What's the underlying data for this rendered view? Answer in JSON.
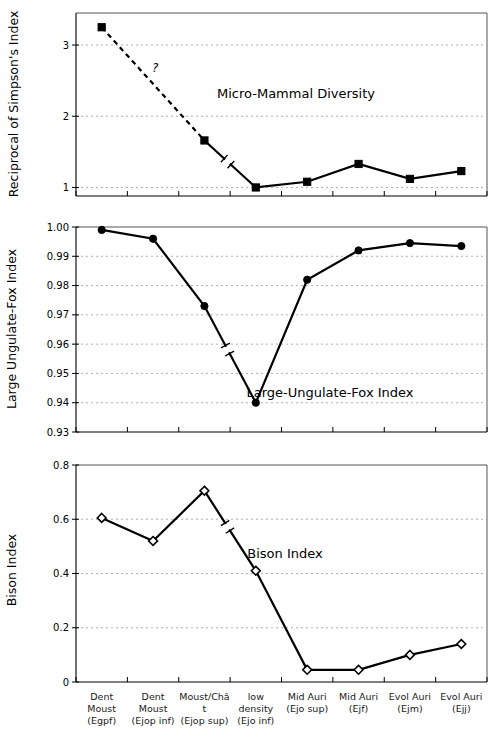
{
  "figure": {
    "width": 503,
    "height": 737,
    "background": "#ffffff",
    "ink_color": "#000000",
    "grid_color": "#9a9a9a"
  },
  "x_categories": [
    {
      "top": "Dent Moust",
      "bottom": "(Egpf)"
    },
    {
      "top": "Dent Moust",
      "bottom": "(Ejop inf)"
    },
    {
      "top": "Moust/Châ t",
      "bottom": "(Ejop sup)"
    },
    {
      "top": "low density",
      "bottom": "(Ejo inf)"
    },
    {
      "top": "Mid Auri",
      "bottom": "(Ejo sup)"
    },
    {
      "top": "Mid Auri",
      "bottom": "(Ejf)"
    },
    {
      "top": "Evol Auri",
      "bottom": "(Ejm)"
    },
    {
      "top": "Evol Auri",
      "bottom": "(Ejj)"
    }
  ],
  "chart_data": [
    {
      "type": "line",
      "id": "micro-mammal-diversity",
      "title": "Micro-Mammal Diversity",
      "ylabel": "Reciprocal of Simpson's Index",
      "xlabel": "",
      "categories": [
        "Dent Moust (Egpf)",
        "Dent Moust (Ejop inf)",
        "Moust/Châ t (Ejop sup)",
        "low density (Ejo inf)",
        "Mid Auri (Ejo sup)",
        "Mid Auri (Ejf)",
        "Evol Auri (Ejm)",
        "Evol Auri (Ejj)"
      ],
      "values": [
        3.25,
        null,
        1.66,
        1.0,
        1.08,
        1.33,
        1.12,
        1.23
      ],
      "ylim": [
        0.88,
        3.45
      ],
      "yticks": [
        1,
        2,
        3
      ],
      "ytick_labels": [
        "1",
        "2",
        "3"
      ],
      "grid": true,
      "marker": "filled-square",
      "dashed_segment": {
        "from_index": 0,
        "to_index": 2,
        "label": "?"
      },
      "break_marker_between": [
        2,
        3
      ],
      "legend": "none",
      "note": "Value for category 2 (Dent Moust Ejop inf) not measured; dashed interpolation with question mark"
    },
    {
      "type": "line",
      "id": "large-ungulate-fox-index",
      "title": "Large-Ungulate-Fox Index",
      "ylabel": "Large Ungulate-Fox Index",
      "xlabel": "",
      "categories": [
        "Dent Moust (Egpf)",
        "Dent Moust (Ejop inf)",
        "Moust/Châ t (Ejop sup)",
        "low density (Ejo inf)",
        "Mid Auri (Ejo sup)",
        "Mid Auri (Ejf)",
        "Evol Auri (Ejm)",
        "Evol Auri (Ejj)"
      ],
      "values": [
        0.999,
        0.996,
        0.973,
        0.94,
        0.982,
        0.992,
        0.9945,
        0.9935
      ],
      "ylim": [
        0.93,
        1.0
      ],
      "yticks": [
        0.93,
        0.94,
        0.95,
        0.96,
        0.97,
        0.98,
        0.99,
        1.0
      ],
      "ytick_labels": [
        "0.93",
        "0.94",
        "0.95",
        "0.96",
        "0.97",
        "0.98",
        "0.99",
        "1.00"
      ],
      "grid": true,
      "marker": "filled-circle",
      "break_marker_between": [
        2,
        3
      ],
      "legend": "none"
    },
    {
      "type": "line",
      "id": "bison-index",
      "title": "Bison Index",
      "ylabel": "Bison Index",
      "xlabel": "",
      "categories": [
        "Dent Moust (Egpf)",
        "Dent Moust (Ejop inf)",
        "Moust/Châ t (Ejop sup)",
        "low density (Ejo inf)",
        "Mid Auri (Ejo sup)",
        "Mid Auri (Ejf)",
        "Evol Auri (Ejm)",
        "Evol Auri (Ejj)"
      ],
      "values": [
        0.605,
        0.52,
        0.705,
        0.41,
        0.045,
        0.045,
        0.1,
        0.14
      ],
      "ylim": [
        0,
        0.8
      ],
      "yticks": [
        0,
        0.2,
        0.4,
        0.6,
        0.8
      ],
      "ytick_labels": [
        "0",
        "0.2",
        "0.4",
        "0.6",
        "0.8"
      ],
      "grid": true,
      "marker": "open-diamond",
      "break_marker_between": [
        2,
        3
      ],
      "legend": "none"
    }
  ]
}
